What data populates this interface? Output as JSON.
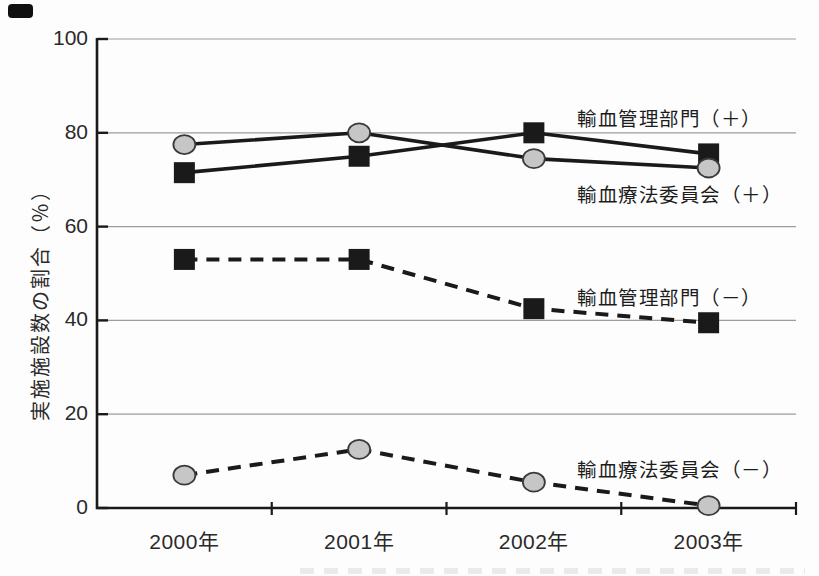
{
  "figure": {
    "background": "#fdfdfd",
    "ink": "#1a1a1a",
    "grid_color": "#9c9c9c",
    "marker_fill_gray": "#c6c6c6",
    "marker_stroke": "#3a3a3a"
  },
  "chart_data": {
    "type": "line",
    "title": "",
    "xlabel": "",
    "ylabel": "実施施設数の割合（％）",
    "x": [
      "2000年",
      "2001年",
      "2002年",
      "2003年"
    ],
    "ylim": [
      0,
      100
    ],
    "y_ticks": [
      0,
      20,
      40,
      60,
      80,
      100
    ],
    "grid": "horizontal gridlines every 20",
    "legend_position": "inline annotations at right of each line",
    "series": [
      {
        "name": "輸血管理部門（＋）",
        "line_style": "solid",
        "marker": "black-square",
        "values": [
          71.5,
          75,
          80,
          75.5
        ]
      },
      {
        "name": "輸血療法委員会（＋）",
        "line_style": "solid",
        "marker": "gray-circle",
        "values": [
          77.5,
          80,
          74.5,
          72.5
        ]
      },
      {
        "name": "輸血管理部門（－）",
        "line_style": "dashed",
        "marker": "black-square",
        "values": [
          53,
          53,
          42.5,
          39.5
        ]
      },
      {
        "name": "輸血療法委員会（－）",
        "line_style": "dashed",
        "marker": "gray-circle",
        "values": [
          7,
          12.5,
          5.5,
          0.5
        ]
      }
    ]
  }
}
